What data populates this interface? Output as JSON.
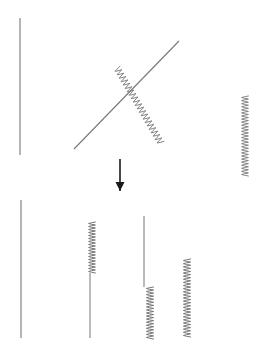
{
  "figure": {
    "title": "",
    "background_color": "#ffffff",
    "stroke_color": "#777777",
    "arrow_color": "#1a1a1a",
    "canvas": {
      "width": 262,
      "height": 359
    },
    "panels": [
      {
        "id": "before",
        "name": "before-panel",
        "label": "",
        "bounds": {
          "x": 0,
          "y": 0,
          "width": 262,
          "height": 158
        },
        "elements": [
          {
            "id": "before-straight-vertical",
            "name": "straight-vertical-left",
            "kind": "straight",
            "orientation": "vertical",
            "x1": 20,
            "y1": 18,
            "x2": 20,
            "y2": 155,
            "stroke_width": 1.1
          },
          {
            "id": "before-straight-diagonal",
            "name": "straight-diagonal",
            "kind": "straight",
            "orientation": "diagonal-up-right",
            "x1": 74,
            "y1": 149,
            "x2": 179,
            "y2": 41,
            "stroke_width": 1.1
          },
          {
            "id": "before-coil-diagonal",
            "name": "coil-diagonal",
            "kind": "coil",
            "orientation": "diagonal-down-right",
            "x1": 117,
            "y1": 68,
            "x2": 161,
            "y2": 143,
            "coils": 22,
            "amplitude": 3.4,
            "stroke_width": 0.9
          },
          {
            "id": "before-coil-vertical",
            "name": "coil-vertical-right",
            "kind": "coil",
            "orientation": "vertical",
            "x1": 245,
            "y1": 96,
            "x2": 245,
            "y2": 176,
            "coils": 26,
            "amplitude": 3.4,
            "stroke_width": 0.9
          }
        ]
      },
      {
        "id": "transition",
        "name": "transition-panel",
        "label": "",
        "bounds": {
          "x": 0,
          "y": 158,
          "width": 262,
          "height": 40
        },
        "elements": [
          {
            "id": "transform-arrow",
            "name": "down-arrow",
            "kind": "arrow",
            "orientation": "down",
            "x1": 120,
            "y1": 159,
            "x2": 120,
            "y2": 191,
            "head_width": 9,
            "head_length": 9,
            "stroke_width": 1.6
          }
        ]
      },
      {
        "id": "after",
        "name": "after-panel",
        "label": "",
        "bounds": {
          "x": 0,
          "y": 198,
          "width": 262,
          "height": 161
        },
        "elements": [
          {
            "id": "after-strand-1",
            "name": "strand-straight-full",
            "kind": "straight",
            "orientation": "vertical",
            "x1": 21,
            "y1": 200,
            "x2": 21,
            "y2": 338,
            "stroke_width": 1.1
          },
          {
            "id": "after-strand-2",
            "name": "strand-coil-then-straight",
            "kind": "composite",
            "orientation": "vertical",
            "coil_x1": 92,
            "coil_y1": 222,
            "coil_x2": 92,
            "coil_y2": 273,
            "line_x1": 90,
            "line_y1": 273,
            "line_x2": 90,
            "line_y2": 338,
            "coils": 17,
            "amplitude": 3.4,
            "stroke_width": 1.0
          },
          {
            "id": "after-strand-3",
            "name": "strand-straight-then-coil",
            "kind": "composite",
            "orientation": "vertical",
            "line_x1": 144,
            "line_y1": 216,
            "line_x2": 144,
            "line_y2": 287,
            "coil_x1": 150,
            "coil_y1": 287,
            "coil_x2": 150,
            "coil_y2": 339,
            "coils": 17,
            "amplitude": 3.6,
            "stroke_width": 1.0
          },
          {
            "id": "after-strand-4",
            "name": "strand-coil-full",
            "kind": "coil",
            "orientation": "vertical",
            "x1": 187,
            "y1": 259,
            "x2": 187,
            "y2": 337,
            "coils": 25,
            "amplitude": 3.6,
            "stroke_width": 1.0
          }
        ]
      }
    ]
  }
}
